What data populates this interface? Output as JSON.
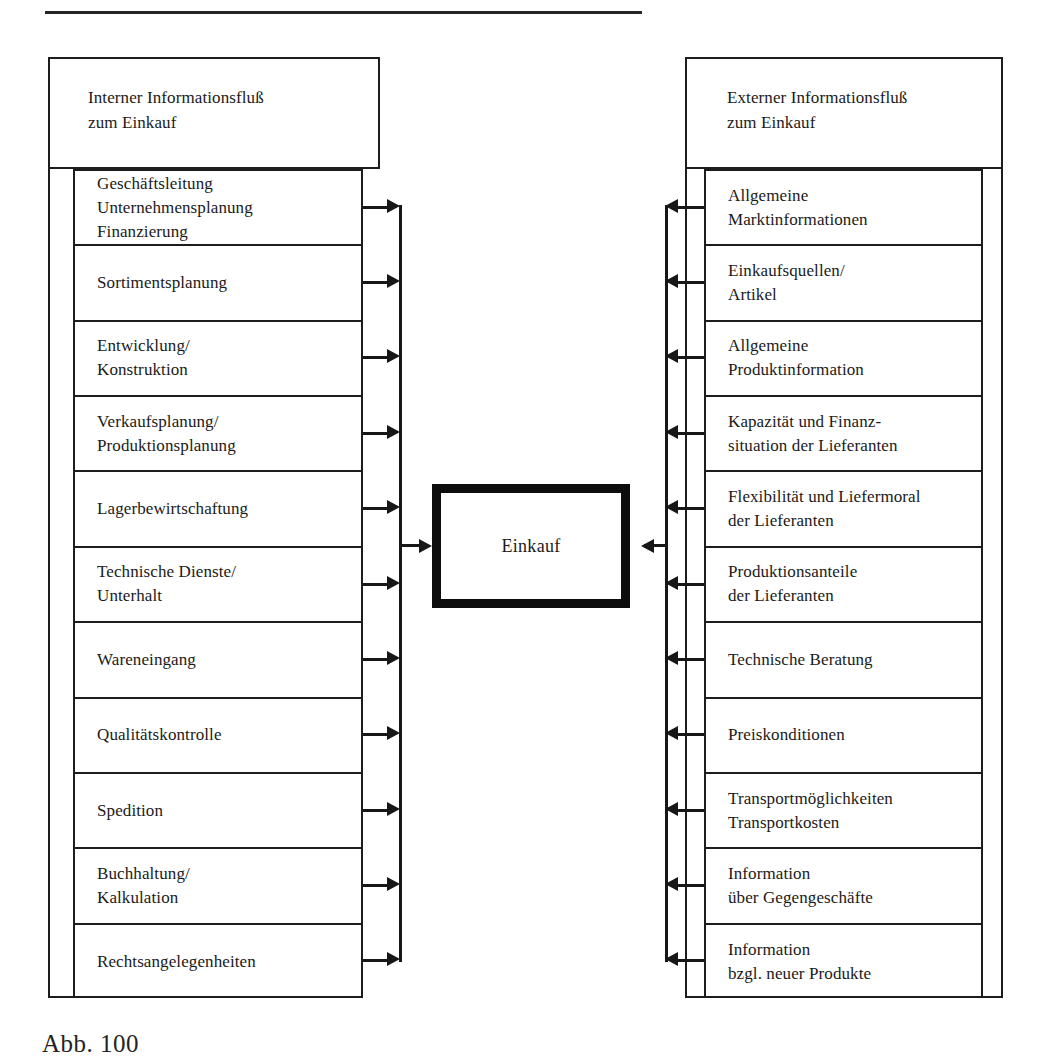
{
  "figure": {
    "center": {
      "label": "Einkauf"
    },
    "caption": "Abb. 100"
  },
  "left_column": {
    "header": {
      "line1": "Interner Informationsfluß",
      "line2": "zum Einkauf"
    },
    "flow_direction": "right",
    "rows": [
      {
        "line1": "Geschäftsleitung",
        "line2": "Unternehmensplanung",
        "line3": "Finanzierung"
      },
      {
        "line1": "Sortimentsplanung",
        "line2": "",
        "line3": ""
      },
      {
        "line1": "Entwicklung/",
        "line2": "Konstruktion",
        "line3": ""
      },
      {
        "line1": "Verkaufsplanung/",
        "line2": "Produktionsplanung",
        "line3": ""
      },
      {
        "line1": "Lagerbewirtschaftung",
        "line2": "",
        "line3": ""
      },
      {
        "line1": "Technische Dienste/",
        "line2": "Unterhalt",
        "line3": ""
      },
      {
        "line1": "Wareneingang",
        "line2": "",
        "line3": ""
      },
      {
        "line1": "Qualitätskontrolle",
        "line2": "",
        "line3": ""
      },
      {
        "line1": "Spedition",
        "line2": "",
        "line3": ""
      },
      {
        "line1": "Buchhaltung/",
        "line2": "Kalkulation",
        "line3": ""
      },
      {
        "line1": "Rechtsangelegenheiten",
        "line2": "",
        "line3": ""
      }
    ]
  },
  "right_column": {
    "header": {
      "line1": "Externer Informationsfluß",
      "line2": "zum Einkauf"
    },
    "flow_direction": "left",
    "rows": [
      {
        "line1": "Allgemeine",
        "line2": "Marktinformationen",
        "line3": ""
      },
      {
        "line1": "Einkaufsquellen/",
        "line2": "Artikel",
        "line3": ""
      },
      {
        "line1": "Allgemeine",
        "line2": "Produktinformation",
        "line3": ""
      },
      {
        "line1": "Kapazität und Finanz-",
        "line2": "situation der Lieferanten",
        "line3": ""
      },
      {
        "line1": "Flexibilität und Liefermoral",
        "line2": "der Lieferanten",
        "line3": ""
      },
      {
        "line1": "Produktionsanteile",
        "line2": "der Lieferanten",
        "line3": ""
      },
      {
        "line1": "Technische Beratung",
        "line2": "",
        "line3": ""
      },
      {
        "line1": "Preiskonditionen",
        "line2": "",
        "line3": ""
      },
      {
        "line1": "Transportmöglichkeiten",
        "line2": "Transportkosten",
        "line3": ""
      },
      {
        "line1": "Information",
        "line2": "über Gegengeschäfte",
        "line3": ""
      },
      {
        "line1": "Information",
        "line2": "bzgl. neuer Produkte",
        "line3": ""
      }
    ]
  },
  "colors": {
    "ink": "#1d1d1d",
    "paper": "#ffffff",
    "heavy": "#0d0d0d"
  }
}
